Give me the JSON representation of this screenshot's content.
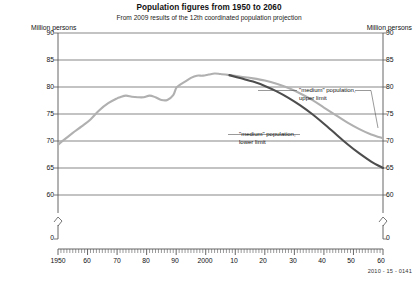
{
  "header": {
    "title": "Population figures from 1950 to 2060",
    "subtitle": "From 2009 results of the 12th coordinated population projection"
  },
  "axes": {
    "y_unit_left": "Million persons",
    "y_unit_right": "Million persons",
    "y_ticks": [
      "90",
      "85",
      "80",
      "75",
      "70",
      "65",
      "60",
      "0"
    ],
    "x_ticks": [
      "1950",
      "60",
      "70",
      "80",
      "90",
      "2000",
      "10",
      "20",
      "30",
      "40",
      "50",
      "60"
    ]
  },
  "annotations": {
    "upper_line1": "\"medium\" population,",
    "upper_line2": "upper limit",
    "lower_line1": "\"medium\" population,",
    "lower_line2": "lower limit"
  },
  "footer": {
    "source_code": "2010 - 15 - 0141"
  },
  "colors": {
    "upper_limit": "#b0b0b0",
    "lower_limit": "#4d4d4d",
    "historical": "#b0b0b0",
    "grid": "#555555",
    "axis": "#555555",
    "text": "#111111"
  },
  "chart_data": {
    "type": "line",
    "title": "Population figures from 1950 to 2060",
    "subtitle": "From 2009 results of the 12th coordinated population projection",
    "xlabel": "",
    "ylabel": "Million persons",
    "xlim": [
      1950,
      2060
    ],
    "ylim": [
      58,
      90
    ],
    "y_axis_break_below": 58,
    "grid": "horizontal",
    "legend": "annotations-on-plot",
    "series": [
      {
        "name": "Historical population",
        "color": "#b0b0b0",
        "x": [
          1950,
          1952,
          1955,
          1958,
          1961,
          1964,
          1967,
          1970,
          1971,
          1973,
          1975,
          1977,
          1979,
          1981,
          1983,
          1985,
          1987,
          1989,
          1990,
          1991,
          1993,
          1995,
          1997,
          1999,
          2001,
          2003,
          2005,
          2008
        ],
        "values": [
          69.3,
          70.2,
          71.5,
          72.7,
          74.0,
          75.7,
          77.0,
          77.9,
          78.1,
          78.4,
          78.2,
          78.1,
          78.1,
          78.4,
          78.1,
          77.6,
          77.6,
          78.5,
          79.8,
          80.3,
          81.0,
          81.7,
          82.1,
          82.1,
          82.3,
          82.5,
          82.4,
          82.2
        ]
      },
      {
        "name": "\"medium\" population, upper limit",
        "color": "#b0b0b0",
        "x": [
          2008,
          2012,
          2016,
          2020,
          2024,
          2028,
          2032,
          2036,
          2040,
          2044,
          2048,
          2052,
          2056,
          2060
        ],
        "values": [
          82.2,
          81.9,
          81.6,
          81.2,
          80.6,
          79.8,
          78.8,
          77.6,
          76.2,
          74.8,
          73.4,
          72.2,
          71.2,
          70.5
        ]
      },
      {
        "name": "\"medium\" population, lower limit",
        "color": "#4d4d4d",
        "x": [
          2008,
          2012,
          2016,
          2020,
          2024,
          2028,
          2032,
          2036,
          2040,
          2044,
          2048,
          2052,
          2056,
          2060
        ],
        "values": [
          82.2,
          81.6,
          81.0,
          80.2,
          79.2,
          78.0,
          76.6,
          75.0,
          73.2,
          71.3,
          69.4,
          67.7,
          66.2,
          65.0
        ]
      }
    ]
  }
}
